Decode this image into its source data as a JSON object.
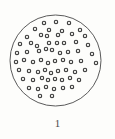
{
  "figure": {
    "kind": "scatter-in-circle",
    "caption": "1",
    "alt_title": "Circle containing scattered ring dots",
    "background_color": "#fdfdfb",
    "stroke_color": "#5b5b5b",
    "dot_stroke_color": "#3a3a3a",
    "dot_fill_color": "#f2f2ef",
    "caption_color": "#4a4a4a"
  },
  "chart_data": {
    "type": "scatter",
    "title": "1",
    "xlabel": "",
    "ylabel": "",
    "grid": false,
    "legend": null,
    "xlim": [
      0,
      115
    ],
    "ylim": [
      0,
      139
    ],
    "boundary": {
      "shape": "circle",
      "cx": 55.5,
      "cy": 60.5,
      "r": 45.5,
      "stroke_width": 1
    },
    "point_count": 65,
    "point_marker": "open-circle",
    "point_radius": 1.7,
    "points": [
      {
        "x": 44,
        "y": 23
      },
      {
        "x": 56,
        "y": 22
      },
      {
        "x": 69,
        "y": 23
      },
      {
        "x": 35,
        "y": 29
      },
      {
        "x": 49,
        "y": 30
      },
      {
        "x": 62,
        "y": 31
      },
      {
        "x": 80,
        "y": 30
      },
      {
        "x": 27,
        "y": 37
      },
      {
        "x": 41,
        "y": 35
      },
      {
        "x": 47,
        "y": 36
      },
      {
        "x": 58,
        "y": 35
      },
      {
        "x": 72,
        "y": 34
      },
      {
        "x": 85,
        "y": 36
      },
      {
        "x": 20,
        "y": 44
      },
      {
        "x": 31,
        "y": 43
      },
      {
        "x": 37,
        "y": 46
      },
      {
        "x": 49,
        "y": 43
      },
      {
        "x": 57,
        "y": 43
      },
      {
        "x": 64,
        "y": 43
      },
      {
        "x": 76,
        "y": 42
      },
      {
        "x": 88,
        "y": 45
      },
      {
        "x": 17,
        "y": 53
      },
      {
        "x": 27,
        "y": 52
      },
      {
        "x": 39,
        "y": 51
      },
      {
        "x": 46,
        "y": 49
      },
      {
        "x": 52,
        "y": 50
      },
      {
        "x": 60,
        "y": 53
      },
      {
        "x": 68,
        "y": 52
      },
      {
        "x": 78,
        "y": 51
      },
      {
        "x": 92,
        "y": 54
      },
      {
        "x": 16,
        "y": 62
      },
      {
        "x": 24,
        "y": 60
      },
      {
        "x": 33,
        "y": 62
      },
      {
        "x": 41,
        "y": 60
      },
      {
        "x": 48,
        "y": 63
      },
      {
        "x": 55,
        "y": 61
      },
      {
        "x": 63,
        "y": 60
      },
      {
        "x": 71,
        "y": 62
      },
      {
        "x": 81,
        "y": 61
      },
      {
        "x": 96,
        "y": 63
      },
      {
        "x": 19,
        "y": 70
      },
      {
        "x": 29,
        "y": 71
      },
      {
        "x": 38,
        "y": 72
      },
      {
        "x": 45,
        "y": 70
      },
      {
        "x": 51,
        "y": 73
      },
      {
        "x": 58,
        "y": 71
      },
      {
        "x": 66,
        "y": 70
      },
      {
        "x": 75,
        "y": 72
      },
      {
        "x": 85,
        "y": 70
      },
      {
        "x": 23,
        "y": 79
      },
      {
        "x": 33,
        "y": 80
      },
      {
        "x": 42,
        "y": 78
      },
      {
        "x": 48,
        "y": 80
      },
      {
        "x": 55,
        "y": 79
      },
      {
        "x": 62,
        "y": 80
      },
      {
        "x": 70,
        "y": 78
      },
      {
        "x": 79,
        "y": 80
      },
      {
        "x": 29,
        "y": 88
      },
      {
        "x": 38,
        "y": 89
      },
      {
        "x": 46,
        "y": 87
      },
      {
        "x": 54,
        "y": 89
      },
      {
        "x": 63,
        "y": 88
      },
      {
        "x": 72,
        "y": 87
      },
      {
        "x": 40,
        "y": 96
      },
      {
        "x": 52,
        "y": 96
      }
    ]
  }
}
